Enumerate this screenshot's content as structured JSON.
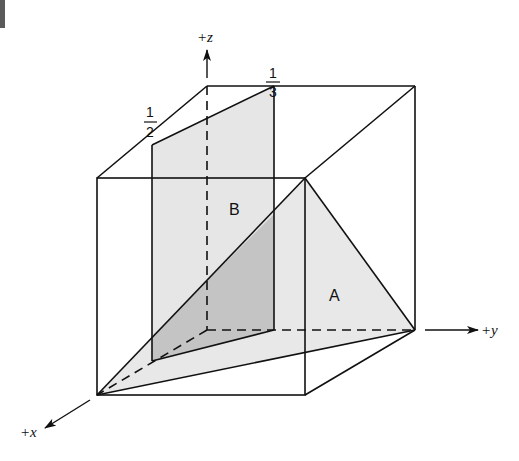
{
  "diagram": {
    "type": "3d-cube-planes",
    "axes": {
      "z": {
        "label": "+z"
      },
      "y": {
        "label": "+y"
      },
      "x": {
        "label": "+x"
      }
    },
    "intercepts": {
      "half": {
        "numerator": "1",
        "denominator": "2"
      },
      "third": {
        "numerator": "1",
        "denominator": "3"
      }
    },
    "regions": {
      "plane_b": {
        "label": "B",
        "fill": "#e6e6e6"
      },
      "plane_a": {
        "label": "A",
        "fill": "#e8e8e8"
      },
      "overlap": {
        "fill": "#c4c4c4"
      }
    },
    "colors": {
      "line": "#111111",
      "background": "#ffffff"
    }
  }
}
